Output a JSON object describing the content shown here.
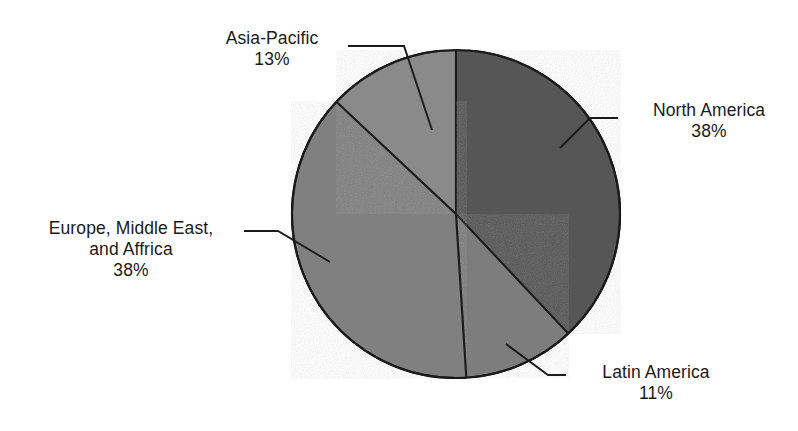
{
  "chart_data": {
    "type": "pie",
    "title": "",
    "subtitle": "",
    "xlabel": "",
    "ylabel": "",
    "legend_position": "none",
    "grid": false,
    "start_angle_deg": 0,
    "categories": [
      "North America",
      "Latin America",
      "Europe, Middle East, and Affrica",
      "Asia-Pacific"
    ],
    "values": [
      38,
      11,
      38,
      13
    ],
    "value_unit": "%",
    "slices": [
      {
        "label": "North America",
        "value": 38,
        "value_text": "38%",
        "color": "#575757",
        "start_deg": 0,
        "end_deg": 136.8
      },
      {
        "label": "Latin America",
        "value": 11,
        "value_text": "11%",
        "color": "#7d7d7d",
        "start_deg": 136.8,
        "end_deg": 176.4
      },
      {
        "label": "Europe, Middle East, and Affrica",
        "value": 38,
        "value_text": "38%",
        "color": "#808080",
        "start_deg": 176.4,
        "end_deg": 313.2
      },
      {
        "label": "Asia-Pacific",
        "value": 13,
        "value_text": "13%",
        "color": "#8a8a8a",
        "start_deg": 313.2,
        "end_deg": 360
      }
    ]
  },
  "labels": {
    "asia_pacific": {
      "name": "Asia-Pacific",
      "value": "13%"
    },
    "north_america": {
      "name": "North America",
      "value": "38%"
    },
    "emea": {
      "name_line1": "Europe, Middle East,",
      "name_line2": "and Affrica",
      "value": "38%"
    },
    "latin_america": {
      "name": "Latin America",
      "value": "11%"
    }
  },
  "colors": {
    "background": "#ffffff",
    "outline": "#1a1a1a",
    "text": "#1a1a1a",
    "north_america": "#575757",
    "latin_america": "#7d7d7d",
    "emea": "#808080",
    "asia_pacific": "#8a8a8a"
  }
}
